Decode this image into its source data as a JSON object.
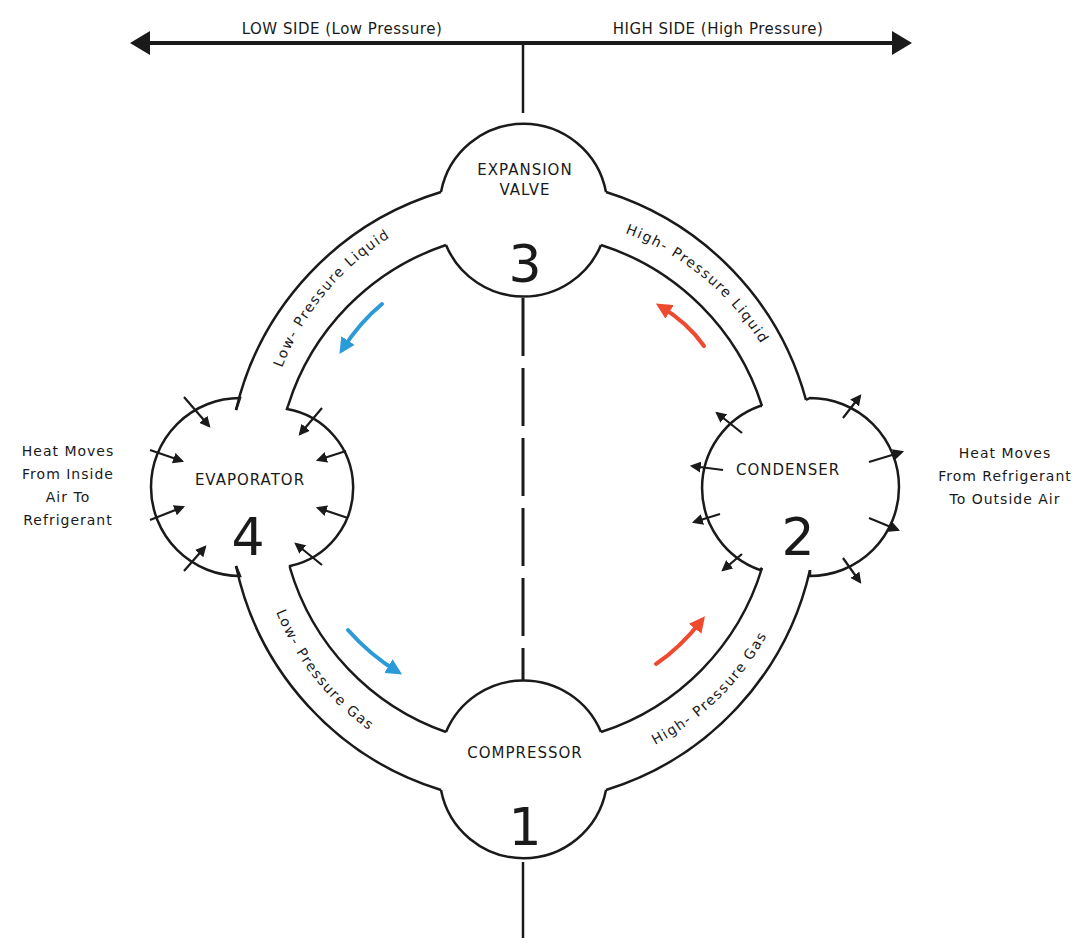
{
  "pressure_axis": {
    "low_side_label": "LOW SIDE (Low Pressure)",
    "high_side_label": "HIGH SIDE (High Pressure)"
  },
  "components": {
    "compressor": {
      "name": "COMPRESSOR",
      "number": "1"
    },
    "condenser": {
      "name": "CONDENSER",
      "number": "2"
    },
    "expansion_valve": {
      "name_line1": "EXPANSION",
      "name_line2": "VALVE",
      "number": "3"
    },
    "evaporator": {
      "name": "EVAPORATOR",
      "number": "4"
    }
  },
  "pipes": {
    "low_pressure_liquid": "Low- Pressure Liquid",
    "high_pressure_liquid": "High- Pressure Liquid",
    "low_pressure_gas": "Low- Pressure Gas",
    "high_pressure_gas": "High- Pressure Gas"
  },
  "notes": {
    "evaporator_heat": [
      "Heat Moves",
      "From Inside",
      "Air To",
      "Refrigerant"
    ],
    "condenser_heat": [
      "Heat Moves",
      "From Refrigerant",
      "To Outside Air"
    ]
  },
  "colors": {
    "low_side_flow": "#2a9ad8",
    "high_side_flow": "#ee4a30",
    "line": "#1a1a1a"
  }
}
